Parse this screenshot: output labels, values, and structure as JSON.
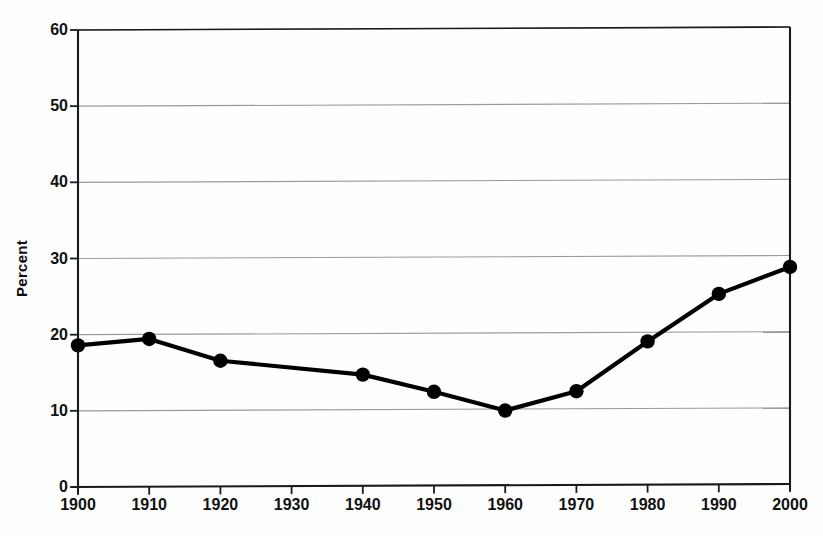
{
  "chart_data": {
    "type": "line",
    "title": "",
    "xlabel": "",
    "ylabel": "Percent",
    "xlim": [
      1900,
      2000
    ],
    "ylim": [
      0,
      60
    ],
    "grid": true,
    "legend": "none",
    "x": [
      1900,
      1910,
      1920,
      1940,
      1950,
      1960,
      1970,
      1980,
      1990,
      2000
    ],
    "values": [
      18.6,
      19.4,
      16.5,
      14.6,
      12.3,
      9.8,
      12.3,
      18.8,
      25.0,
      28.5
    ],
    "series": [
      {
        "name": "Percent",
        "x": [
          1900,
          1910,
          1920,
          1940,
          1950,
          1960,
          1970,
          1980,
          1990,
          2000
        ],
        "values": [
          18.6,
          19.4,
          16.5,
          14.6,
          12.3,
          9.8,
          12.3,
          18.8,
          25.0,
          28.5
        ]
      }
    ],
    "x_tick_labels": [
      "1900",
      "1910",
      "1920",
      "1930",
      "1940",
      "1950",
      "1960",
      "1970",
      "1980",
      "1990",
      "2000"
    ],
    "x_ticks": [
      1900,
      1910,
      1920,
      1930,
      1940,
      1950,
      1960,
      1970,
      1980,
      1990,
      2000
    ],
    "y_tick_labels": [
      "0",
      "10",
      "20",
      "30",
      "40",
      "50",
      "60"
    ],
    "y_ticks": [
      0,
      10,
      20,
      30,
      40,
      50,
      60
    ],
    "marker": "filled-circle",
    "marker_color": "#000000",
    "line_color": "#000000",
    "gridline_color": "#8a8a8a",
    "axis_color": "#1a1a1a",
    "background_color": "#ffffff"
  },
  "axes": {
    "y_title": "Percent"
  }
}
